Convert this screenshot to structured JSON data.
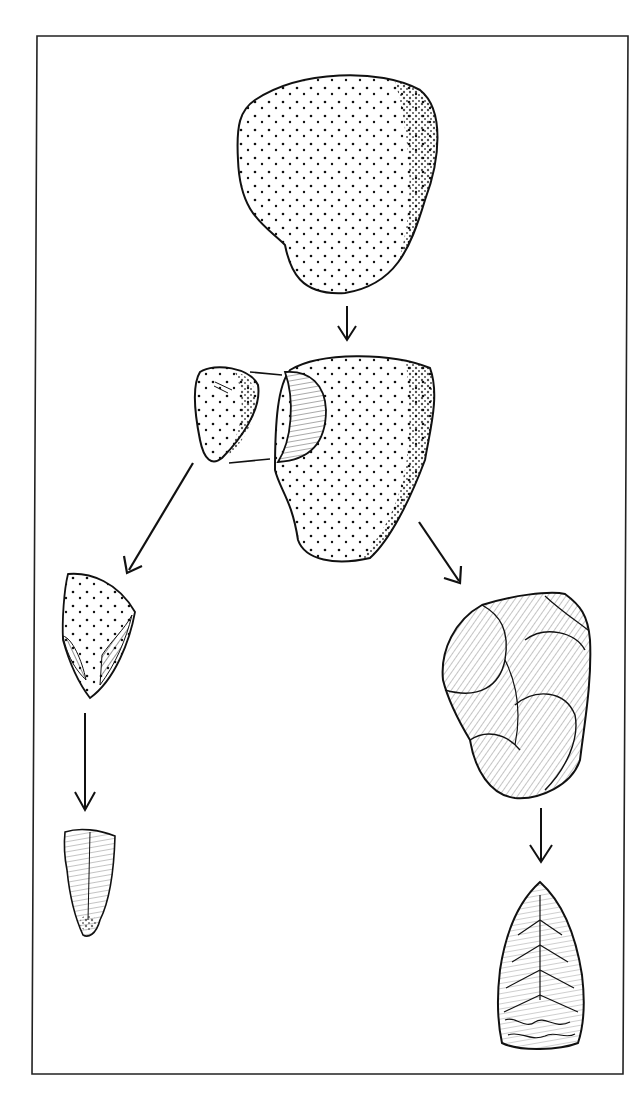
{
  "figure": {
    "title": "",
    "frame_color": "#222222",
    "ink_color": "#111111",
    "background": "#ffffff"
  },
  "nodes": [
    {
      "id": "nodule",
      "label": "",
      "kind": "cortex-nodule"
    },
    {
      "id": "split-flake",
      "label": "",
      "kind": "cortical-flake"
    },
    {
      "id": "split-core",
      "label": "",
      "kind": "core-with-flake-scar"
    },
    {
      "id": "flake-blank",
      "label": "",
      "kind": "flake"
    },
    {
      "id": "flake-tool",
      "label": "",
      "kind": "retouched-tool"
    },
    {
      "id": "worked-core",
      "label": "",
      "kind": "flaked-core"
    },
    {
      "id": "handaxe",
      "label": "",
      "kind": "bifacial-point"
    }
  ],
  "edges": [
    {
      "from": "nodule",
      "to": "split-core"
    },
    {
      "from": "split-flake",
      "to": "flake-blank"
    },
    {
      "from": "split-core",
      "to": "worked-core"
    },
    {
      "from": "flake-blank",
      "to": "flake-tool"
    },
    {
      "from": "worked-core",
      "to": "handaxe"
    }
  ]
}
